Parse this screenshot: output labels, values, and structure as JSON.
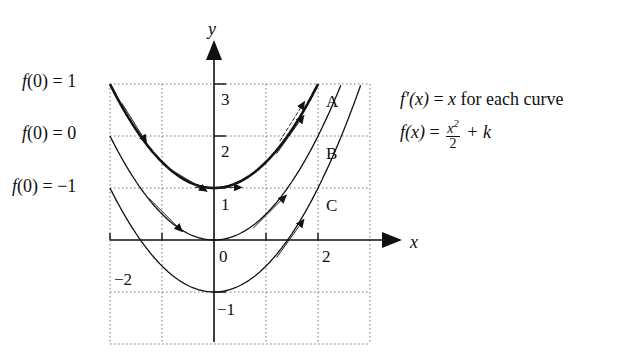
{
  "figure": {
    "axes": {
      "x_label": "x",
      "y_label": "y",
      "x_ticks": [
        {
          "value": -2,
          "label": "−2"
        },
        {
          "value": 0,
          "label": "0"
        },
        {
          "value": 2,
          "label": "2"
        }
      ],
      "y_ticks": [
        {
          "value": 3,
          "label": "3"
        },
        {
          "value": 2,
          "label": "2"
        },
        {
          "value": 1,
          "label": "1"
        },
        {
          "value": -1,
          "label": "−1"
        }
      ],
      "grid": {
        "x_min": -2,
        "x_max": 3,
        "y_min": -2,
        "y_max": 3,
        "style": "dotted"
      },
      "origin_px": {
        "x": 214,
        "y": 240
      },
      "unit_px": 52
    },
    "initial_conditions": [
      {
        "fn": "f",
        "arg": "0",
        "value": "1"
      },
      {
        "fn": "f",
        "arg": "0",
        "value": "0"
      },
      {
        "fn": "f",
        "arg": "0",
        "value": "−1"
      }
    ],
    "curves": [
      {
        "label": "A",
        "k": 1,
        "bold": true
      },
      {
        "label": "B",
        "k": 0,
        "bold": false
      },
      {
        "label": "C",
        "k": -1,
        "bold": false
      }
    ],
    "formulas": {
      "derivative": {
        "lhs": "f′(x)",
        "eq": "=",
        "rhs": "x",
        "tail": "for each curve"
      },
      "general": {
        "lhs": "f(x)",
        "eq": "=",
        "num": "x",
        "num_sup": "2",
        "den": "2",
        "tail": "+ k"
      }
    },
    "tangent_arrows": [
      {
        "curve": "A",
        "x0": -1.6,
        "dashed": false
      },
      {
        "curve": "A",
        "x0": 0.0,
        "dashed": false
      },
      {
        "curve": "A",
        "x0": 1.6,
        "dashed": true
      },
      {
        "curve": "A",
        "x0": 1.4,
        "dashed": false
      },
      {
        "curve": "A",
        "x0": -0.6,
        "dashed": false
      },
      {
        "curve": "B",
        "x0": -1.0,
        "dashed": false
      },
      {
        "curve": "B",
        "x0": 1.0,
        "dashed": false
      },
      {
        "curve": "C",
        "x0": 1.4,
        "dashed": false
      }
    ]
  }
}
